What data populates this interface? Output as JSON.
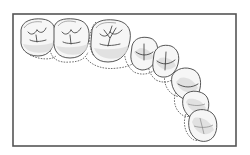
{
  "figure": {
    "type": "dental-arch-occlusal-diagram",
    "frame": {
      "x": 13,
      "y": 14,
      "width": 223,
      "height": 132,
      "stroke": "#555555"
    },
    "colors": {
      "outline": "#444444",
      "fill": "#f6f6f6",
      "shading": "#dcdcdc",
      "dashed": "#333333"
    },
    "teeth": [
      {
        "id": "molar-1",
        "kind": "molar",
        "cx": 36,
        "cy": 39
      },
      {
        "id": "molar-2",
        "kind": "molar",
        "cx": 71,
        "cy": 41
      },
      {
        "id": "molar-3",
        "kind": "molar",
        "cx": 111,
        "cy": 44
      },
      {
        "id": "premolar-1",
        "kind": "premolar",
        "cx": 143,
        "cy": 56
      },
      {
        "id": "premolar-2",
        "kind": "premolar",
        "cx": 165,
        "cy": 64
      },
      {
        "id": "canine",
        "kind": "canine",
        "cx": 186,
        "cy": 84
      },
      {
        "id": "incisor-lateral",
        "kind": "incisor",
        "cx": 196,
        "cy": 106
      },
      {
        "id": "incisor-central",
        "kind": "incisor",
        "cx": 205,
        "cy": 128
      }
    ],
    "legend": {
      "solid_outline": "tooth contour",
      "dashed_outline": "alternate arch position"
    }
  }
}
